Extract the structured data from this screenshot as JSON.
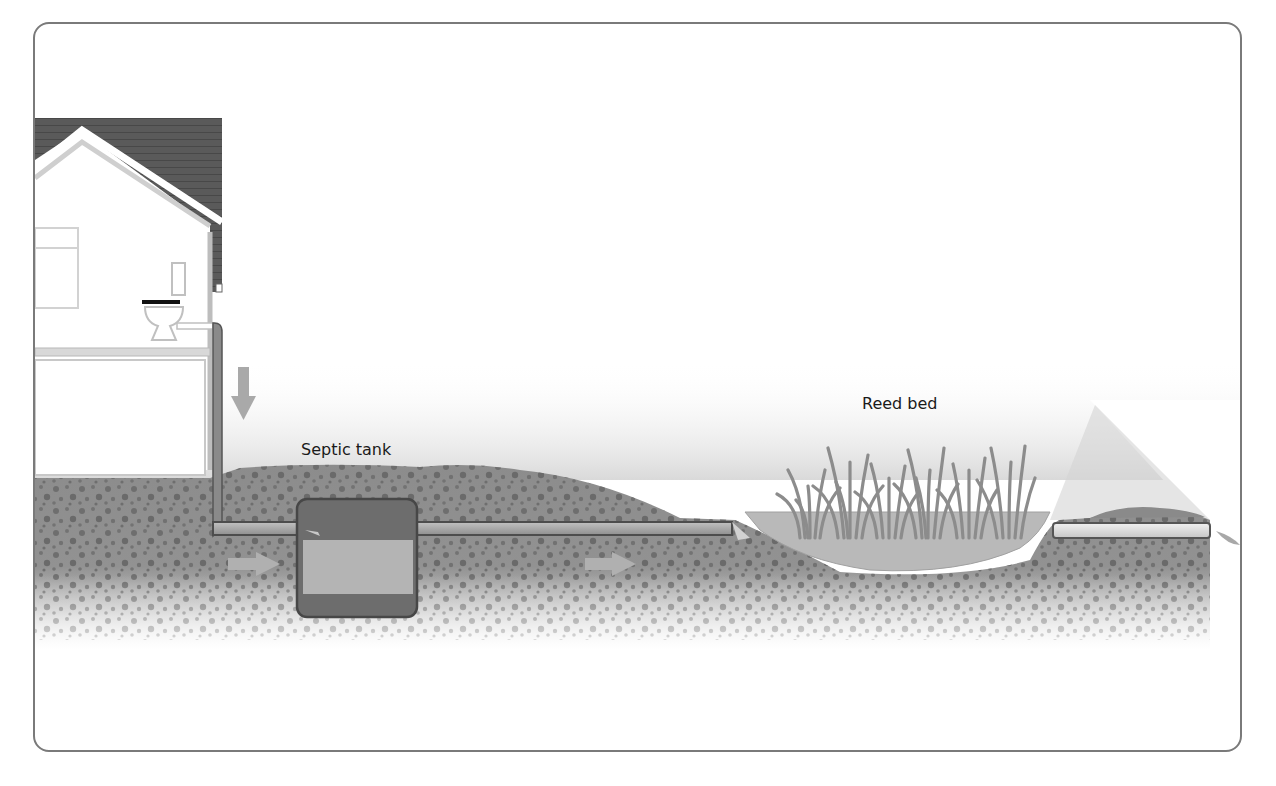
{
  "diagram": {
    "type": "septic-system-cross-section",
    "labels": {
      "septic_tank": "Septic tank",
      "reed_bed": "Reed bed"
    },
    "components": [
      {
        "name": "house",
        "features": [
          "roof",
          "window",
          "toilet",
          "floor"
        ]
      },
      {
        "name": "downpipe",
        "flow_arrow": "down"
      },
      {
        "name": "inlet-pipe",
        "flow_arrow": "right"
      },
      {
        "name": "septic-tank",
        "layers": [
          "scum",
          "liquid",
          "sludge"
        ]
      },
      {
        "name": "outlet-pipe",
        "flow_arrow": "right"
      },
      {
        "name": "reed-bed",
        "reed_clumps": 6
      },
      {
        "name": "drain-pipe"
      }
    ],
    "colors": {
      "soil": "#8a8a8a",
      "pipe": "#9a9a9a",
      "pipe_outline": "#555555",
      "roof": "#555555",
      "tank_body": "#6d6d6d",
      "tank_liquid": "#b4b4b4",
      "reed": "#8c8c8c",
      "arrow": "#a8a8a8",
      "frame": "#7a7a7a"
    }
  }
}
